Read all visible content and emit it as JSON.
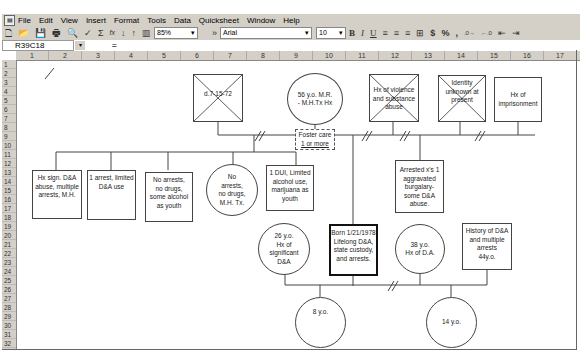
{
  "menu": {
    "items": [
      "File",
      "Edit",
      "View",
      "Insert",
      "Format",
      "Tools",
      "Data",
      "Quicksheet",
      "Window",
      "Help"
    ]
  },
  "toolbar": {
    "zoom": "85%",
    "font": "Arial",
    "font_size": "10",
    "bold": "B",
    "italic": "I",
    "underline": "U",
    "currency": "$",
    "percent": "%",
    "comma": ",",
    "sum": "Σ",
    "fx": "fx"
  },
  "formula_bar": {
    "name_box": "R39C18",
    "equals": "="
  },
  "columns": [
    "1",
    "2",
    "3",
    "4",
    "5",
    "6",
    "7",
    "8",
    "9",
    "10",
    "11",
    "12",
    "13",
    "14",
    "15",
    "16",
    "17"
  ],
  "rows": [
    "1",
    "2",
    "3",
    "4",
    "5",
    "6",
    "7",
    "8",
    "9",
    "10",
    "11",
    "12",
    "13",
    "14",
    "15",
    "16",
    "17",
    "18",
    "19",
    "20",
    "21",
    "22",
    "23",
    "24",
    "25",
    "26",
    "27",
    "28",
    "29",
    "30",
    "31",
    "32"
  ],
  "genogram": {
    "grandfather_deceased": "d.7-15-72",
    "grandmother": [
      "56 y.o. M.R.",
      "- M.H.Tx Hx"
    ],
    "foster_care": [
      "Foster care",
      "1 or more"
    ],
    "father_line_male": [
      "Hx of violence",
      "and substance",
      "abuse"
    ],
    "father_line_unknown": [
      "Identity",
      "unknown at",
      "present"
    ],
    "imprisonment": [
      "Hx of",
      "imprisonment"
    ],
    "sibling1": [
      "Hx sign. D&A",
      "abuse, multiple",
      "arrests, M.H."
    ],
    "sibling2": [
      "1 arrest, limited",
      "D&A use"
    ],
    "sibling3": [
      "No arrests,",
      "no drugs,",
      "some alcohol",
      "as youth"
    ],
    "sibling4": [
      "No",
      "arrests,",
      "no drugs,",
      "M.H. Tx."
    ],
    "sibling5": [
      "1 DUI, Limited",
      "alcohol use,",
      "marijuana as",
      "youth"
    ],
    "father": [
      "Arrested x's 1",
      "aggravated",
      "burgalary-",
      "some D&A",
      "abuse."
    ],
    "partner1": [
      "26 y.o.",
      "Hx of",
      "significant",
      "D&A"
    ],
    "client": [
      "Born 1/21/1978",
      "Lifelong D&A,",
      "state custody,",
      "and arrests."
    ],
    "partner2": [
      "38 y.o.",
      "Hx of D.A."
    ],
    "partner3": [
      "History of D&A",
      "and multiple",
      "arrests",
      "44y.o."
    ],
    "child1": "8 y.o.",
    "child2": "14 y.o."
  }
}
